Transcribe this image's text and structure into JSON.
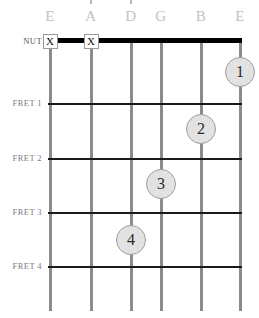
{
  "diagram": {
    "type": "guitar-chord-fretboard",
    "width": 259,
    "height": 318,
    "background_color": "#ffffff",
    "string_line_color": "#8c8c8c",
    "fret_line_color": "#1a1a1a",
    "nut_line_color": "#000000",
    "dot_fill_color": "#e2e2e2",
    "dot_border_color": "#9e9e9e",
    "string_name_color": "#c2c2c2",
    "row_label_color": "#7d7d7d"
  },
  "string_names": [
    {
      "label": "E",
      "x": 50
    },
    {
      "label": "A",
      "x": 91
    },
    {
      "label": "D",
      "x": 131
    },
    {
      "label": "G",
      "x": 161
    },
    {
      "label": "B",
      "x": 201
    },
    {
      "label": "E",
      "x": 240
    }
  ],
  "row_labels": [
    {
      "label": "NUT",
      "y": 36
    },
    {
      "label": "FRET 1",
      "y": 98
    },
    {
      "label": "FRET 2",
      "y": 153
    },
    {
      "label": "FRET 3",
      "y": 207
    },
    {
      "label": "FRET 4",
      "y": 261
    }
  ],
  "fret_lines": [
    {
      "name": "nut",
      "y": 38,
      "thick": true
    },
    {
      "name": "fret-1",
      "y": 103,
      "thick": false
    },
    {
      "name": "fret-2",
      "y": 158,
      "thick": false
    },
    {
      "name": "fret-3",
      "y": 212,
      "thick": false
    },
    {
      "name": "fret-4",
      "y": 266,
      "thick": false
    }
  ],
  "mute_markers": [
    {
      "symbol": "X",
      "string": "E",
      "x": 50,
      "y": 41
    },
    {
      "symbol": "X",
      "string": "A",
      "x": 91,
      "y": 41
    }
  ],
  "finger_dots": [
    {
      "number": "1",
      "string": "E-high",
      "fret": 1,
      "x": 240,
      "y": 72
    },
    {
      "number": "2",
      "string": "B",
      "fret": 2,
      "x": 201,
      "y": 129
    },
    {
      "number": "3",
      "string": "G",
      "fret": 3,
      "x": 161,
      "y": 184
    },
    {
      "number": "4",
      "string": "D",
      "fret": 4,
      "x": 131,
      "y": 240
    }
  ],
  "string_geometry": {
    "top": 38,
    "bottom": 311,
    "x_positions": [
      50,
      91,
      131,
      161,
      201,
      240
    ]
  }
}
